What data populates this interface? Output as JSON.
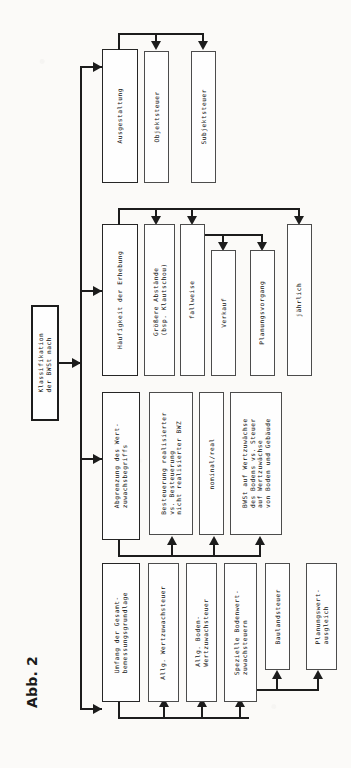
{
  "figure": {
    "caption": "Abb. 2"
  },
  "root": {
    "label": "Klassifikation\nder BWSt nach"
  },
  "branches": [
    {
      "id": "ausgestaltung",
      "label": "Ausgestaltung",
      "children": [
        {
          "label": "Objektsteuer"
        },
        {
          "label": "Subjektsteuer"
        }
      ]
    },
    {
      "id": "haeufigkeit",
      "label": "Häufigkeit der Erhebung",
      "children": [
        {
          "label": "Größere Abstände\n(bsp. Klautschou)"
        },
        {
          "label": "fallweise"
        },
        {
          "label": "Verkauf"
        },
        {
          "label": "Planungsvorgang"
        },
        {
          "label": "jährlich"
        }
      ]
    },
    {
      "id": "abgrenzung",
      "label": "Abgrenzung des Wert-\nzuwachsbegriffs",
      "children": [
        {
          "label": "Besteuerung realisierter\nvs. Besteuerung\nnicht realisierter BWZ"
        },
        {
          "label": "nominal/real"
        },
        {
          "label": "BWSt auf Wertzuwächse\ndes Bodens vs. Steuer\nauf Wertzuwächse\nvon Boden und Gebäude"
        }
      ]
    },
    {
      "id": "umfang",
      "label": "Umfang der Gesamt-\nbemessungsgrundlage",
      "children": [
        {
          "label": "Allg. Wertzuwachsteuer"
        },
        {
          "label": "Allg. Boden-\nWertzuwachsteuer"
        },
        {
          "label": "Spezielle Bodenwert-\nzuwachsteuern"
        },
        {
          "label": "Baulandsteuer"
        },
        {
          "label": "Planungswert-\nausgleich"
        }
      ]
    }
  ],
  "colors": {
    "ink": "#1c1c1c",
    "box_border": "#4c4c4c",
    "paper": "#fbfaf8"
  }
}
